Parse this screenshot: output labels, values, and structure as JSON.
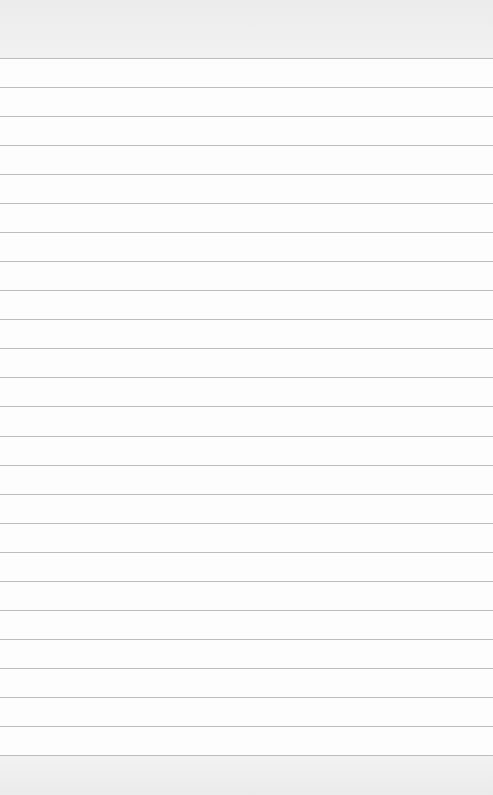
{
  "paper": {
    "type": "lined-paper",
    "background_color": "#fdfdfd",
    "margin_band_color": "#eeeeee",
    "rule_color": "#bdbdbd",
    "first_rule_y": 58,
    "rule_spacing": 29.04,
    "rule_count": 25
  }
}
